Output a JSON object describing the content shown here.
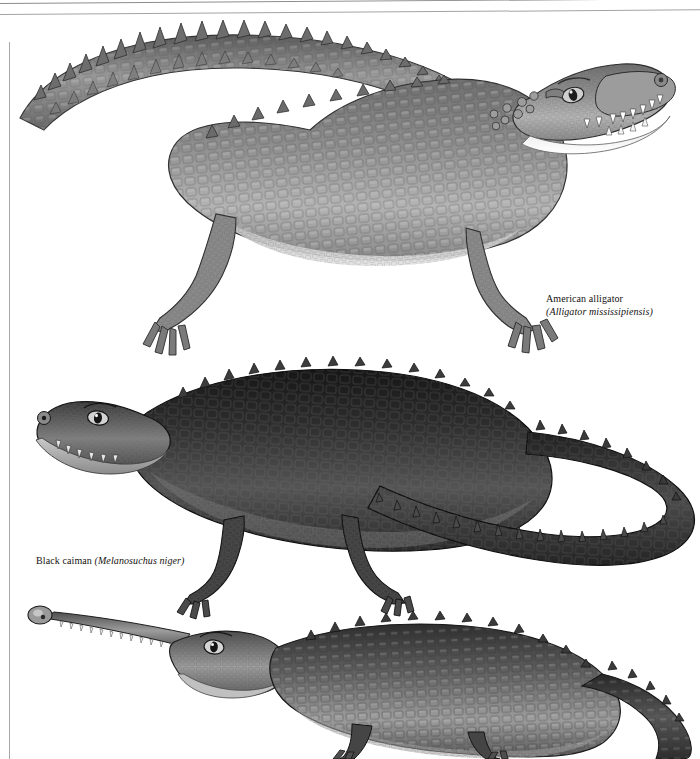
{
  "page": {
    "kind": "reference-plate",
    "background_color": "#ffffff",
    "ink_color": "#15120f",
    "rule_color": "#8c8c8c",
    "width": 700,
    "height": 759
  },
  "rules": {
    "top_rule_1": "horizontal-rule",
    "top_rule_2": "horizontal-rule",
    "left_rule": "vertical-rule"
  },
  "captions": [
    {
      "id": "alligator",
      "common_name": "American alligator",
      "scientific_name": "(Alligator mississipiensis)"
    },
    {
      "id": "caiman",
      "common_name": "Black caiman ",
      "scientific_name": "(Melanosuchus niger)"
    }
  ],
  "illustrations": [
    {
      "id": "american-alligator",
      "label": "American alligator",
      "facing": "right",
      "tone": "mid-gray",
      "body_fill": "#8e8e8e",
      "shadow_fill": "#4a4a4a",
      "highlight_fill": "#d5d5d5"
    },
    {
      "id": "black-caiman",
      "label": "Black caiman",
      "facing": "left",
      "tone": "dark",
      "body_fill": "#3f3f3f",
      "shadow_fill": "#1c1c1c",
      "highlight_fill": "#9a9a9a"
    },
    {
      "id": "gharial",
      "label": "Gharial",
      "facing": "left",
      "tone": "mid-dark",
      "body_fill": "#6b6b6b",
      "shadow_fill": "#2a2a2a",
      "highlight_fill": "#c2c2c2"
    }
  ]
}
